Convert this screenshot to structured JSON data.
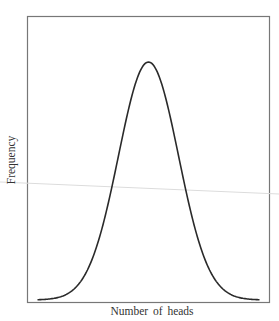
{
  "chart_data": {
    "type": "line",
    "title": "",
    "xlabel": "Number of heads",
    "ylabel": "Frequency",
    "grid": false,
    "legend": null,
    "x_ticks": [],
    "y_ticks": [],
    "series": [
      {
        "name": "distribution",
        "distribution": "normal",
        "x": [
          -3.7,
          -3,
          -2.5,
          -2,
          -1.5,
          -1,
          -0.5,
          0,
          0.5,
          1,
          1.5,
          2,
          2.5,
          3,
          3.7
        ],
        "values": [
          0.001,
          0.011,
          0.044,
          0.135,
          0.325,
          0.607,
          0.882,
          1.0,
          0.882,
          0.607,
          0.325,
          0.135,
          0.044,
          0.011,
          0.001
        ]
      }
    ]
  },
  "colors": {
    "curve": "#2a2a2a",
    "frame": "#777777",
    "scan_line": "#dcdcdc"
  }
}
